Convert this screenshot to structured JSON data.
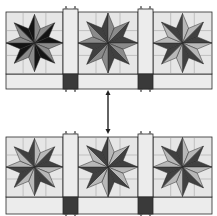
{
  "diagram": {
    "type": "quilt-row-transformation",
    "colors": {
      "background_square": "#e6e6e6",
      "sashing": "#ececec",
      "cornerstone": "#3a3a3a",
      "outline": "#2a2a2a",
      "black": "#141414",
      "dark": "#404040",
      "mid": "#8a8a8a",
      "light": "#b8b8b8",
      "arrow": "#222222"
    },
    "rows": [
      {
        "name": "top-row",
        "y": 12,
        "star_height": 62,
        "strip_height": 15,
        "blocks": [
          {
            "name": "block-1",
            "x": 6,
            "width": 57,
            "dark": "black",
            "light": "mid"
          },
          {
            "name": "block-2",
            "x": 78,
            "width": 60,
            "dark": "dark",
            "light": "mid"
          },
          {
            "name": "block-3",
            "x": 153,
            "width": 59,
            "dark": "dark",
            "light": "light"
          }
        ],
        "sashing": [
          {
            "x": 63,
            "width": 15
          },
          {
            "x": 138,
            "width": 15
          }
        ]
      },
      {
        "name": "bottom-row",
        "y": 137,
        "star_height": 60,
        "strip_height": 17,
        "blocks": [
          {
            "name": "block-1",
            "x": 6,
            "width": 57,
            "dark": "dark",
            "light": "light"
          },
          {
            "name": "block-2",
            "x": 78,
            "width": 60,
            "dark": "dark",
            "light": "light"
          },
          {
            "name": "block-3",
            "x": 153,
            "width": 59,
            "dark": "dark",
            "light": "light"
          }
        ],
        "sashing": [
          {
            "x": 63,
            "width": 15
          },
          {
            "x": 138,
            "width": 15
          }
        ]
      }
    ],
    "arrow": {
      "x": 108,
      "y1": 90,
      "y2": 134,
      "direction": "both"
    }
  }
}
